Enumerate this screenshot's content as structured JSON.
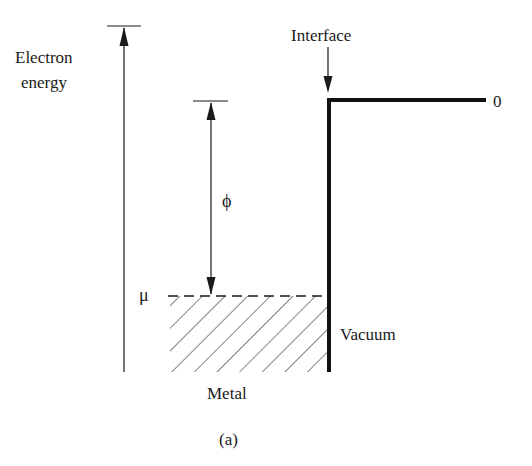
{
  "figure": {
    "caption": "(a)",
    "colors": {
      "ink": "#1a1a1a",
      "background": "#ffffff"
    }
  },
  "labels": {
    "axis_line1": "Electron",
    "axis_line2": "energy",
    "interface": "Interface",
    "zero_level": "0",
    "chemical_potential": "μ",
    "work_function": "ϕ",
    "vacuum": "Vacuum",
    "metal": "Metal"
  }
}
